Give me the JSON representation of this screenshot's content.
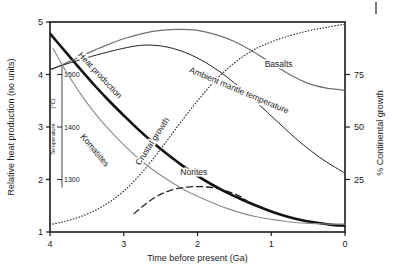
{
  "chart_data": {
    "type": "line",
    "title": "",
    "xlabel": "Time before present (Ga)",
    "ylabel": "Relative heat production (no units)",
    "y2label": "% Continental growth",
    "xlim": [
      4,
      0
    ],
    "ylim": [
      1,
      5
    ],
    "y2lim": [
      0,
      100
    ],
    "xticks": [
      4,
      3,
      2,
      1,
      0
    ],
    "xtick_labels": [
      "4",
      "3",
      "2",
      "1",
      "0"
    ],
    "yticks": [
      1,
      2,
      3,
      4,
      5
    ],
    "ytick_labels": [
      "1",
      "2",
      "3",
      "4",
      "5"
    ],
    "y2ticks": [
      25,
      50,
      75
    ],
    "y2tick_labels": [
      "25",
      "50",
      "75"
    ],
    "grid": false,
    "legend": "inline-curve-labels",
    "inset_axis": {
      "name": "temperature-axis",
      "label": "Temperature",
      "units": "(°C)",
      "ticks": [
        1300,
        1400,
        1500
      ],
      "tick_labels": [
        "1300",
        "1400",
        "1500"
      ],
      "tick_positions_in_left_units": [
        2,
        3,
        4
      ]
    },
    "series": [
      {
        "name": "Heat production",
        "label": "Heat production",
        "style": "solid",
        "width": 2.6,
        "color": "#111111",
        "points": [
          [
            4.0,
            4.78
          ],
          [
            3.8,
            4.45
          ],
          [
            3.6,
            4.12
          ],
          [
            3.4,
            3.8
          ],
          [
            3.2,
            3.5
          ],
          [
            3.0,
            3.22
          ],
          [
            2.8,
            2.95
          ],
          [
            2.6,
            2.7
          ],
          [
            2.4,
            2.47
          ],
          [
            2.2,
            2.26
          ],
          [
            2.0,
            2.07
          ],
          [
            1.8,
            1.9
          ],
          [
            1.6,
            1.75
          ],
          [
            1.4,
            1.62
          ],
          [
            1.2,
            1.5
          ],
          [
            1.0,
            1.39
          ],
          [
            0.8,
            1.3
          ],
          [
            0.6,
            1.23
          ],
          [
            0.4,
            1.18
          ],
          [
            0.2,
            1.14
          ],
          [
            0.0,
            1.12
          ]
        ]
      },
      {
        "name": "Basalts",
        "label": "Basalts",
        "style": "solid",
        "width": 1.2,
        "color": "#6e6e6e",
        "points": [
          [
            4.0,
            4.08
          ],
          [
            3.75,
            4.24
          ],
          [
            3.5,
            4.4
          ],
          [
            3.25,
            4.55
          ],
          [
            3.0,
            4.68
          ],
          [
            2.75,
            4.78
          ],
          [
            2.5,
            4.84
          ],
          [
            2.25,
            4.86
          ],
          [
            2.0,
            4.84
          ],
          [
            1.75,
            4.76
          ],
          [
            1.5,
            4.63
          ],
          [
            1.25,
            4.44
          ],
          [
            1.0,
            4.22
          ],
          [
            0.75,
            4.0
          ],
          [
            0.5,
            3.83
          ],
          [
            0.25,
            3.74
          ],
          [
            0.0,
            3.7
          ]
        ]
      },
      {
        "name": "Crustal growth",
        "label": "Crustal growth",
        "style": "dotted",
        "width": 1.2,
        "color": "#333333",
        "points": [
          [
            4.0,
            1.14
          ],
          [
            3.75,
            1.22
          ],
          [
            3.5,
            1.34
          ],
          [
            3.25,
            1.52
          ],
          [
            3.0,
            1.78
          ],
          [
            2.75,
            2.14
          ],
          [
            2.5,
            2.58
          ],
          [
            2.25,
            3.05
          ],
          [
            2.0,
            3.5
          ],
          [
            1.75,
            3.9
          ],
          [
            1.5,
            4.22
          ],
          [
            1.25,
            4.46
          ],
          [
            1.0,
            4.62
          ],
          [
            0.75,
            4.74
          ],
          [
            0.5,
            4.83
          ],
          [
            0.25,
            4.9
          ],
          [
            0.0,
            4.96
          ]
        ]
      },
      {
        "name": "Ambient mantle temperature",
        "label": "Ambient mantle temperature",
        "style": "solid",
        "width": 1.0,
        "color": "#222222",
        "points": [
          [
            4.0,
            4.1
          ],
          [
            3.5,
            4.32
          ],
          [
            3.0,
            4.5
          ],
          [
            2.7,
            4.56
          ],
          [
            2.4,
            4.52
          ],
          [
            2.1,
            4.38
          ],
          [
            1.8,
            4.15
          ],
          [
            1.5,
            3.84
          ],
          [
            1.2,
            3.47
          ],
          [
            0.9,
            3.08
          ],
          [
            0.6,
            2.7
          ],
          [
            0.3,
            2.38
          ],
          [
            0.0,
            2.12
          ]
        ]
      },
      {
        "name": "Komatiites",
        "label": "Komatiites",
        "style": "solid",
        "width": 1.1,
        "color": "#8a8a8a",
        "points": [
          [
            3.96,
            4.5
          ],
          [
            3.8,
            4.1
          ],
          [
            3.6,
            3.66
          ],
          [
            3.4,
            3.28
          ],
          [
            3.2,
            2.95
          ],
          [
            3.0,
            2.66
          ],
          [
            2.8,
            2.4
          ],
          [
            2.6,
            2.18
          ],
          [
            2.4,
            1.99
          ],
          [
            2.2,
            1.82
          ],
          [
            2.0,
            1.68
          ],
          [
            1.8,
            1.56
          ],
          [
            1.6,
            1.45
          ],
          [
            1.4,
            1.36
          ],
          [
            1.2,
            1.29
          ],
          [
            1.0,
            1.24
          ],
          [
            0.8,
            1.2
          ],
          [
            0.6,
            1.17
          ],
          [
            0.4,
            1.16
          ],
          [
            0.2,
            1.15
          ],
          [
            0.0,
            1.15
          ]
        ]
      },
      {
        "name": "Norites",
        "label": "Norites",
        "style": "dashed",
        "width": 1.3,
        "color": "#222222",
        "points": [
          [
            2.86,
            1.35
          ],
          [
            2.75,
            1.48
          ],
          [
            2.62,
            1.62
          ],
          [
            2.48,
            1.73
          ],
          [
            2.3,
            1.82
          ],
          [
            2.1,
            1.86
          ],
          [
            1.9,
            1.86
          ],
          [
            1.7,
            1.82
          ],
          [
            1.52,
            1.74
          ],
          [
            1.4,
            1.66
          ],
          [
            1.32,
            1.58
          ]
        ]
      }
    ],
    "annotations": [
      {
        "name": "label-heat-production",
        "text": "Heat production",
        "x": 3.35,
        "y": 3.95,
        "rotation": 47
      },
      {
        "name": "label-crustal-growth",
        "text": "Crustal growth",
        "x": 2.58,
        "y": 2.7,
        "rotation": -57
      },
      {
        "name": "label-komatiites",
        "text": "Komatiites",
        "x": 3.42,
        "y": 2.52,
        "rotation": 50
      },
      {
        "name": "label-norites",
        "text": "Norites",
        "x": 2.05,
        "y": 2.08,
        "rotation": 0
      },
      {
        "name": "label-basalts",
        "text": "Basalts",
        "x": 0.9,
        "y": 4.15,
        "rotation": 0
      },
      {
        "name": "label-ambient-mantle-temperature",
        "text": "Ambient mantle temperature",
        "x": 1.45,
        "y": 3.65,
        "rotation": 23
      }
    ]
  }
}
